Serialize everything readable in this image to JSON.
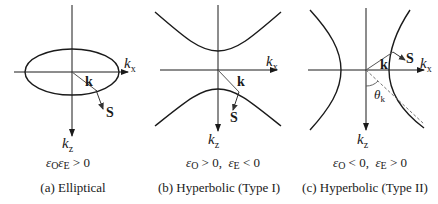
{
  "panels": [
    {
      "id": "a",
      "type": "elliptical",
      "axis_x_label": "k",
      "axis_x_sub": "x",
      "axis_z_label": "k",
      "axis_z_sub": "z",
      "wave_vector_label": "k",
      "poynting_label": "S",
      "condition": "εOεE > 0",
      "condition_parts": {
        "a": "ε",
        "a_sub": "O",
        "b": "ε",
        "b_sub": "E",
        "rel": " > 0"
      },
      "caption": "(a) Elliptical"
    },
    {
      "id": "b",
      "type": "hyperbolic-type-1",
      "axis_x_label": "k",
      "axis_x_sub": "x",
      "axis_z_label": "k",
      "axis_z_sub": "z",
      "wave_vector_label": "k",
      "poynting_label": "S",
      "condition": "εO > 0, εE < 0",
      "condition_parts": {
        "a": "ε",
        "a_sub": "O",
        "a_rel": " > 0,  ",
        "b": "ε",
        "b_sub": "E",
        "b_rel": " < 0"
      },
      "caption": "(b) Hyperbolic (Type I)"
    },
    {
      "id": "c",
      "type": "hyperbolic-type-2",
      "axis_x_label": "k",
      "axis_x_sub": "x",
      "axis_z_label": "k",
      "axis_z_sub": "z",
      "wave_vector_label": "k",
      "poynting_label": "S",
      "angle_label": "θ",
      "angle_sub": "k",
      "condition": "εO < 0, εE > 0",
      "condition_parts": {
        "a": "ε",
        "a_sub": "O",
        "a_rel": " < 0,  ",
        "b": "ε",
        "b_sub": "E",
        "b_rel": " > 0"
      },
      "caption": "(c) Hyperbolic (Type II)"
    }
  ],
  "colors": {
    "line": "#1a1a1a",
    "vector": "#555555",
    "dashed": "#666666"
  }
}
